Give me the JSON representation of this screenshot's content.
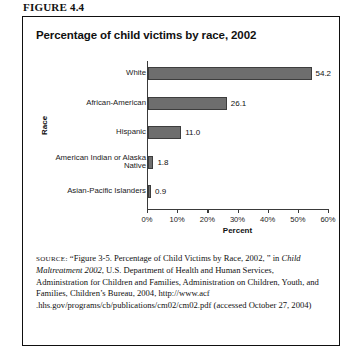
{
  "figure": {
    "caption": "FIGURE 4.4"
  },
  "chart_title": "Percentage of child victims by race, 2002",
  "source": {
    "label": "SOURCE:",
    "part1": " “Figure 3-5. Percentage of Child Victims by Race, 2002, ” in ",
    "italic": "Child Maltreatment 2002",
    "part2": ", U.S. Department of Health and Human Services, Administration for Children and Families, Administration on Children, Youth, and Families, Children’s Bureau, 2004, http://www.acf .hhs.gov/programs/cb/publications/cm02/cm02.pdf (accessed October 27, 2004)"
  },
  "chart_data": {
    "type": "bar",
    "orientation": "horizontal",
    "title": "Percentage of child victims by race, 2002",
    "xlabel": "Percent",
    "ylabel": "Race",
    "categories": [
      "White",
      "African-American",
      "Hispanic",
      "American Indian or Alaska Native",
      "Asian-Pacific Islanders"
    ],
    "values": [
      54.2,
      26.1,
      11.0,
      1.8,
      0.9
    ],
    "data_labels": [
      "54.2",
      "26.1",
      "11.0",
      "1.8",
      "0.9"
    ],
    "xlim": [
      0,
      60
    ],
    "xticks": [
      0,
      10,
      20,
      30,
      40,
      50,
      60
    ],
    "xtick_labels": [
      "0%",
      "10%",
      "20%",
      "30%",
      "40%",
      "50%",
      "60%"
    ],
    "grid": false,
    "legend": false,
    "bar_color": "#6e6e6e",
    "bar_edge_color": "#3d3d3d",
    "axis_color": "#3a3a3a"
  }
}
